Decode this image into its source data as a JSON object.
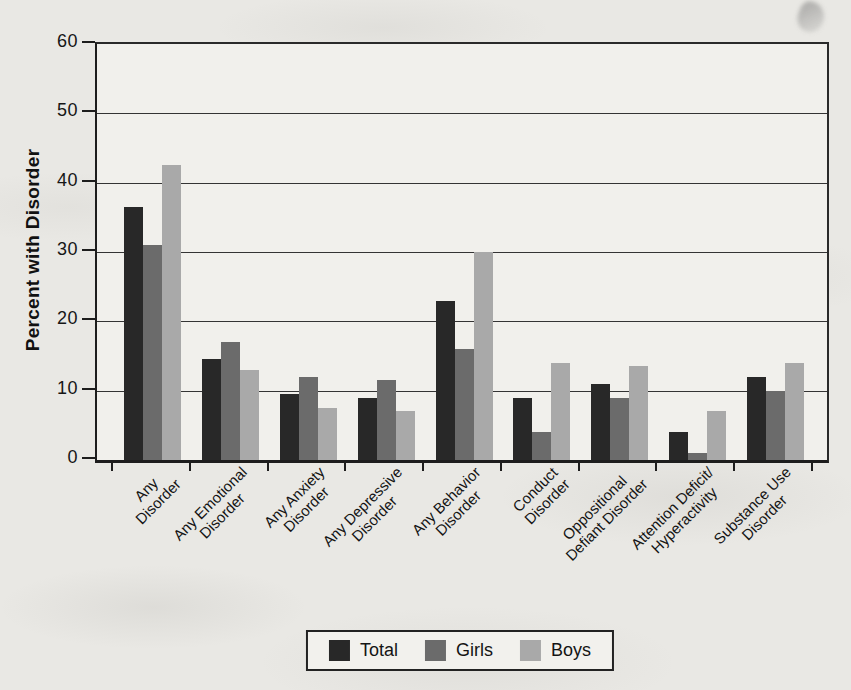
{
  "chart_data": {
    "type": "bar",
    "title": "",
    "xlabel": "",
    "ylabel": "Percent with Disorder",
    "ylim": [
      0,
      60
    ],
    "yticks": [
      0,
      10,
      20,
      30,
      40,
      50,
      60
    ],
    "grid": true,
    "legend_position": "bottom",
    "categories": [
      "Any\nDisorder",
      "Any Emotional\nDisorder",
      "Any Anxiety\nDisorder",
      "Any Depressive\nDisorder",
      "Any Behavior\nDisorder",
      "Conduct\nDisorder",
      "Oppositional\nDefiant Disorder",
      "Attention Deficit/\nHyperactivity",
      "Substance Use\nDisorder"
    ],
    "series": [
      {
        "name": "Total",
        "color": "#282828",
        "values": [
          36.5,
          14.5,
          9.5,
          9,
          23,
          9,
          11,
          4,
          12
        ]
      },
      {
        "name": "Girls",
        "color": "#6b6b6b",
        "values": [
          31,
          17,
          12,
          11.5,
          16,
          4,
          9,
          1,
          10
        ]
      },
      {
        "name": "Boys",
        "color": "#a9a9a9",
        "values": [
          42.5,
          13,
          7.5,
          7,
          30,
          14,
          13.5,
          7,
          14
        ]
      }
    ],
    "colors": {
      "axis": "#1d1d1d",
      "gridline": "#343434",
      "plot_bg": "#f1f0ec",
      "page_bg": "#e9e8e4"
    }
  }
}
